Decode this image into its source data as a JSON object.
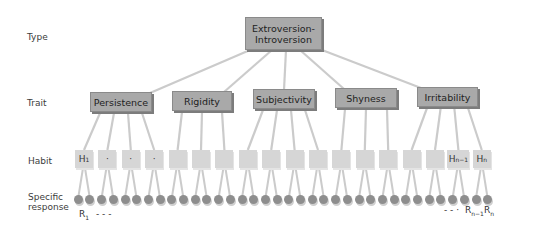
{
  "levels": {
    "type": "Type",
    "trait": "Trait",
    "habit": "Habit",
    "response_line1": "Specific",
    "response_line2": "response"
  },
  "type_node": {
    "line1": "Extroversion-",
    "line2": "Introversion"
  },
  "traits": [
    {
      "label": "Persistence",
      "x": 90,
      "y": 92,
      "w": 62,
      "h": 20
    },
    {
      "label": "Rigidity",
      "x": 172,
      "y": 91,
      "w": 60,
      "h": 20
    },
    {
      "label": "Subjectivity",
      "x": 253,
      "y": 89,
      "w": 62,
      "h": 20
    },
    {
      "label": "Shyness",
      "x": 335,
      "y": 88,
      "w": 62,
      "h": 20
    },
    {
      "label": "Irritability",
      "x": 417,
      "y": 87,
      "w": 61,
      "h": 20
    }
  ],
  "habits": {
    "count": 18,
    "first_label": "H",
    "first_sub": "1",
    "ellipsis": "·",
    "second_last_label": "H",
    "second_last_sub": "n−1",
    "last_label": "H",
    "last_sub": "n"
  },
  "responses": {
    "count": 36,
    "first_label": "R",
    "first_sub": "1",
    "first_dots": "-   -   -",
    "last_dots": "-   -   ·",
    "second_last_label": "R",
    "second_last_sub": "n−1",
    "last_label": "R",
    "last_sub": "n"
  },
  "colors": {
    "box_fill": "#a9a9a9",
    "box_shadow": "#7c7c7c",
    "habit_fill": "#d6d6d6",
    "line": "#cbcbcb",
    "response_fill": "#8e8e8e"
  }
}
